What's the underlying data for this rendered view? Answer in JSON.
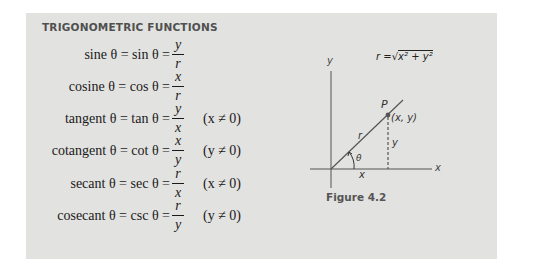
{
  "box": {
    "heading": "TRIGONOMETRIC FUNCTIONS",
    "background": "#e2e2e0"
  },
  "formulas": [
    {
      "lhs": "sine θ = sin θ =",
      "num": "y",
      "den": "r",
      "condition": ""
    },
    {
      "lhs": "cosine θ = cos θ =",
      "num": "x",
      "den": "r",
      "condition": ""
    },
    {
      "lhs": "tangent θ = tan θ =",
      "num": "y",
      "den": "x",
      "condition": "(x ≠ 0)"
    },
    {
      "lhs": "cotangent θ = cot θ =",
      "num": "x",
      "den": "y",
      "condition": "(y ≠ 0)"
    },
    {
      "lhs": "secant θ = sec θ =",
      "num": "r",
      "den": "x",
      "condition": "(x ≠ 0)"
    },
    {
      "lhs": "cosecant θ = csc θ =",
      "num": "r",
      "den": "y",
      "condition": "(y ≠ 0)"
    }
  ],
  "figure": {
    "caption": "Figure 4.2",
    "r_formula_prefix": "r =",
    "r_formula_radicand": "x² + y²",
    "labels": {
      "y_axis": "y",
      "x_axis": "x",
      "point": "P",
      "point_coords": "(x, y)",
      "hypotenuse": "r",
      "vertical_leg": "y",
      "horizontal_leg": "x",
      "angle": "θ"
    }
  }
}
